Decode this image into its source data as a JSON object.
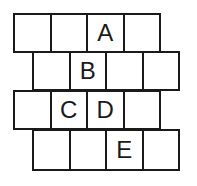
{
  "rows": [
    {
      "cells": [
        "",
        "",
        "A",
        ""
      ]
    },
    {
      "cells": [
        "",
        "B",
        "",
        ""
      ]
    },
    {
      "cells": [
        "",
        "C",
        "D",
        ""
      ]
    },
    {
      "cells": [
        "",
        "",
        "E",
        ""
      ]
    }
  ]
}
